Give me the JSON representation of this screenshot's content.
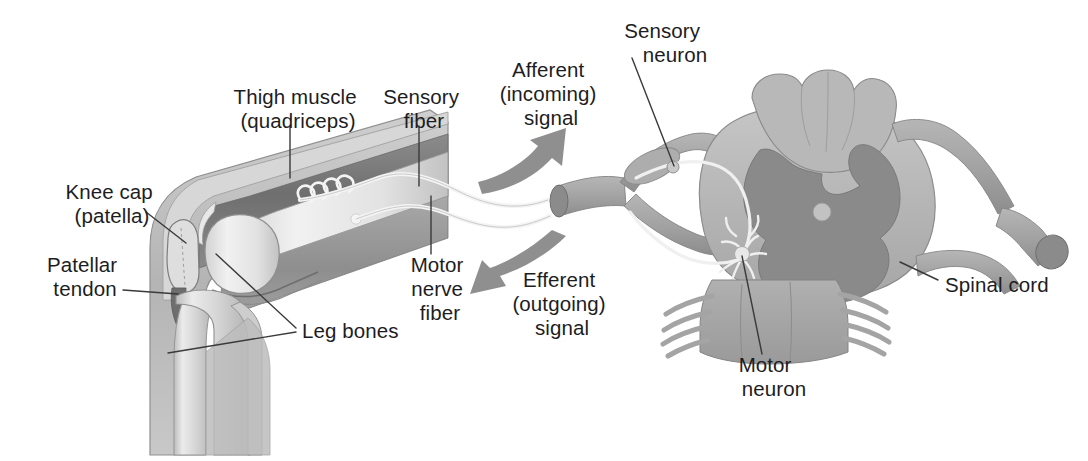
{
  "figure": {
    "background_color": "#ffffff",
    "width": 1088,
    "height": 461
  },
  "palette": {
    "text": "#1d1d1f",
    "leader_line": "#3a3a3c",
    "white_matter": "#b9b9b9",
    "gray_matter": "#8a8a8a",
    "nerve_root": "#a8a8a8",
    "nerve_root_shade": "#8f8f8f",
    "arrow": "#8f8f8f",
    "muscle_dark": "#7e7e7e",
    "muscle_mid": "#9a9a9a",
    "bone_light": "#e4e4e4",
    "bone_mid": "#c6c6c6",
    "skin_outline": "#9c9c9c",
    "tendon": "#6f6f6f",
    "fiber_white": "#f2f2f2"
  },
  "labels": [
    {
      "id": "thigh-muscle",
      "lines": [
        "Thigh muscle",
        "(quadriceps)"
      ],
      "x": 298,
      "y": 110,
      "anchor": "middle",
      "region": "leg"
    },
    {
      "id": "sensory-fiber",
      "lines": [
        "Sensory",
        "fiber"
      ],
      "x": 424,
      "y": 110,
      "anchor": "middle",
      "region": "leg"
    },
    {
      "id": "knee-cap",
      "lines": [
        "Knee cap",
        "(patella)"
      ],
      "x": 112,
      "y": 203,
      "anchor": "middle",
      "region": "leg"
    },
    {
      "id": "patellar-tendon",
      "lines": [
        "Patellar",
        "tendon"
      ],
      "x": 85,
      "y": 276,
      "anchor": "middle",
      "region": "leg"
    },
    {
      "id": "leg-bones",
      "lines": [
        "Leg bones"
      ],
      "x": 302,
      "y": 331,
      "anchor": "start",
      "region": "leg"
    },
    {
      "id": "motor-nerve-fiber",
      "lines": [
        "Motor",
        "nerve",
        "fiber"
      ],
      "x": 440,
      "y": 276,
      "anchor": "middle",
      "region": "leg"
    },
    {
      "id": "afferent-signal",
      "lines": [
        "Afferent",
        "(incoming)",
        "signal"
      ],
      "x": 551,
      "y": 79,
      "anchor": "middle",
      "region": "arrows"
    },
    {
      "id": "efferent-signal",
      "lines": [
        "Efferent",
        "(outgoing)",
        "signal"
      ],
      "x": 562,
      "y": 289,
      "anchor": "middle",
      "region": "arrows"
    },
    {
      "id": "sensory-neuron",
      "lines": [
        "Sensory",
        "neuron"
      ],
      "x": 665,
      "y": 40,
      "anchor": "middle",
      "region": "cord"
    },
    {
      "id": "motor-neuron",
      "lines": [
        "Motor",
        "neuron"
      ],
      "x": 768,
      "y": 372,
      "anchor": "middle",
      "region": "cord"
    },
    {
      "id": "spinal-cord",
      "lines": [
        "Spinal cord"
      ],
      "x": 945,
      "y": 285,
      "anchor": "start",
      "region": "cord"
    }
  ],
  "structures": {
    "leg": {
      "name": "flexed knee cutaway (lateral view)",
      "parts": [
        "thigh muscle (quadriceps)",
        "knee cap (patella)",
        "patellar tendon",
        "femur",
        "tibia",
        "fibula",
        "muscle spindle receptor",
        "motor end plate"
      ]
    },
    "spinal_cord": {
      "name": "spinal cord cross-section",
      "parts": [
        "white matter",
        "butterfly gray matter",
        "central canal",
        "dorsal root",
        "dorsal root ganglion",
        "ventral root",
        "spinal nerve trunk",
        "rootlets"
      ]
    },
    "arrows": [
      {
        "id": "afferent-arrow",
        "direction": "up-right",
        "meaning": "incoming signal toward cord"
      },
      {
        "id": "efferent-arrow",
        "direction": "down-left",
        "meaning": "outgoing signal toward muscle"
      }
    ]
  }
}
